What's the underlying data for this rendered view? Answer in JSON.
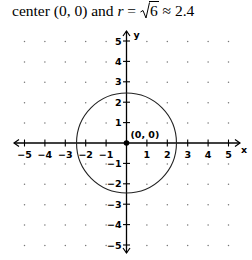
{
  "caption": {
    "prefix": "center (0, 0) and ",
    "r_symbol": "r",
    "equals": " = ",
    "radicand": "6",
    "approx": " ≈ 2.4"
  },
  "chart_data": {
    "type": "line",
    "shape": "circle",
    "center": [
      0,
      0
    ],
    "radius": 2.449,
    "radius_expr": "√6",
    "equation": "x^2 + y^2 = 6",
    "xlabel": "x",
    "ylabel": "y",
    "xlim": [
      -5,
      5
    ],
    "ylim": [
      -5,
      5
    ],
    "x_ticks": [
      -5,
      -4,
      -3,
      -2,
      -1,
      1,
      2,
      3,
      4,
      5
    ],
    "y_ticks": [
      -5,
      -4,
      -3,
      -2,
      -1,
      1,
      2,
      3,
      4,
      5
    ],
    "x_tick_labels": [
      "−5",
      "−4",
      "−3",
      "−2",
      "−1",
      "1",
      "2",
      "3",
      "4",
      "5"
    ],
    "y_tick_labels": [
      "−5",
      "−4",
      "−3",
      "−2",
      "−1",
      "1",
      "2",
      "3",
      "4",
      "5"
    ],
    "grid": "dots",
    "points": [
      {
        "x": 0,
        "y": 0,
        "label": "(0, 0)"
      }
    ],
    "annotations": [
      "(0, 0)"
    ]
  }
}
